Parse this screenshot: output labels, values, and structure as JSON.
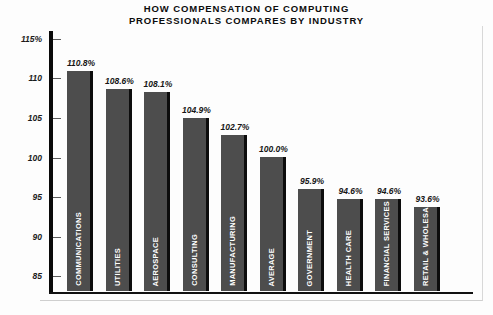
{
  "chart_data": {
    "type": "bar",
    "title": "HOW COMPENSATION OF COMPUTING\nPROFESSIONALS COMPARES BY INDUSTRY",
    "xlabel": "",
    "ylabel": "",
    "ylim": [
      83,
      116
    ],
    "grid": false,
    "legend": "none",
    "y_ticks": [
      "115%",
      "110",
      "105",
      "100",
      "95",
      "90",
      "85"
    ],
    "y_tick_values": [
      115,
      110,
      105,
      100,
      95,
      90,
      85
    ],
    "categories": [
      "COMMUNICATIONS",
      "UTILITIES",
      "AEROSPACE",
      "CONSULTING",
      "MANUFACTURING",
      "AVERAGE",
      "GOVERNMENT",
      "HEALTH CARE",
      "FINANCIAL SERVICES",
      "RETAIL & WHOLESALE"
    ],
    "values": [
      110.8,
      108.6,
      108.1,
      104.9,
      102.7,
      100.0,
      95.9,
      94.6,
      94.6,
      93.6
    ],
    "value_labels": [
      "110.8%",
      "108.6%",
      "108.1%",
      "104.9%",
      "102.7%",
      "100.0%",
      "95.9%",
      "94.6%",
      "94.6%",
      "93.6%"
    ],
    "colors": {
      "bar_fill": "#4d4d4d",
      "bar_shadow": "#0d0d0d",
      "axis": "#0a0a0a",
      "background": "#fdfdfd",
      "text": "#111111",
      "category_text": "#ffffff"
    }
  }
}
